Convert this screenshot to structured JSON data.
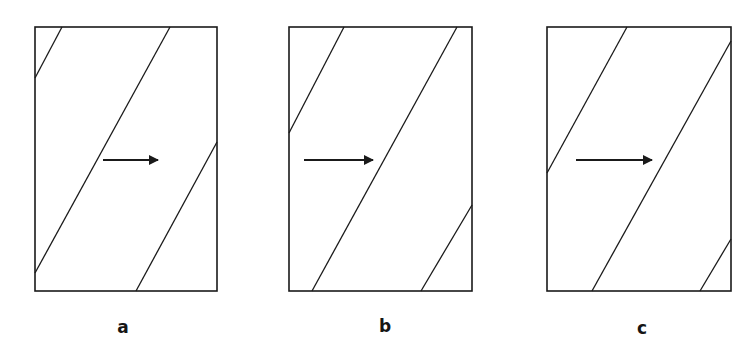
{
  "figure": {
    "type": "schematic",
    "stroke_color": "#1a1a1a",
    "background": "#ffffff"
  },
  "panels": [
    {
      "label": "a",
      "rect": {
        "x": 35,
        "y": 27,
        "w": 182,
        "h": 264
      },
      "lines": [
        {
          "x1": 62,
          "y1": 27,
          "x2": 35,
          "y2": 78
        },
        {
          "x1": 170,
          "y1": 27,
          "x2": 35,
          "y2": 273
        },
        {
          "x1": 217,
          "y1": 142,
          "x2": 136,
          "y2": 291
        }
      ],
      "arrow": {
        "x1": 103,
        "y1": 160,
        "x2": 158,
        "y2": 160
      },
      "label_pos": {
        "x": 123,
        "y": 327
      }
    },
    {
      "label": "b",
      "rect": {
        "x": 289,
        "y": 27,
        "w": 183,
        "h": 264
      },
      "lines": [
        {
          "x1": 344,
          "y1": 27,
          "x2": 289,
          "y2": 133
        },
        {
          "x1": 457,
          "y1": 27,
          "x2": 312,
          "y2": 291
        },
        {
          "x1": 472,
          "y1": 205,
          "x2": 421,
          "y2": 291
        }
      ],
      "arrow": {
        "x1": 304,
        "y1": 160,
        "x2": 373,
        "y2": 160
      },
      "label_pos": {
        "x": 385,
        "y": 326
      }
    },
    {
      "label": "c",
      "rect": {
        "x": 547,
        "y": 27,
        "w": 184,
        "h": 264
      },
      "lines": [
        {
          "x1": 627,
          "y1": 27,
          "x2": 547,
          "y2": 173
        },
        {
          "x1": 731,
          "y1": 41,
          "x2": 592,
          "y2": 291
        },
        {
          "x1": 731,
          "y1": 239,
          "x2": 700,
          "y2": 291
        }
      ],
      "arrow": {
        "x1": 576,
        "y1": 160,
        "x2": 652,
        "y2": 160
      },
      "label_pos": {
        "x": 642,
        "y": 328
      }
    }
  ]
}
